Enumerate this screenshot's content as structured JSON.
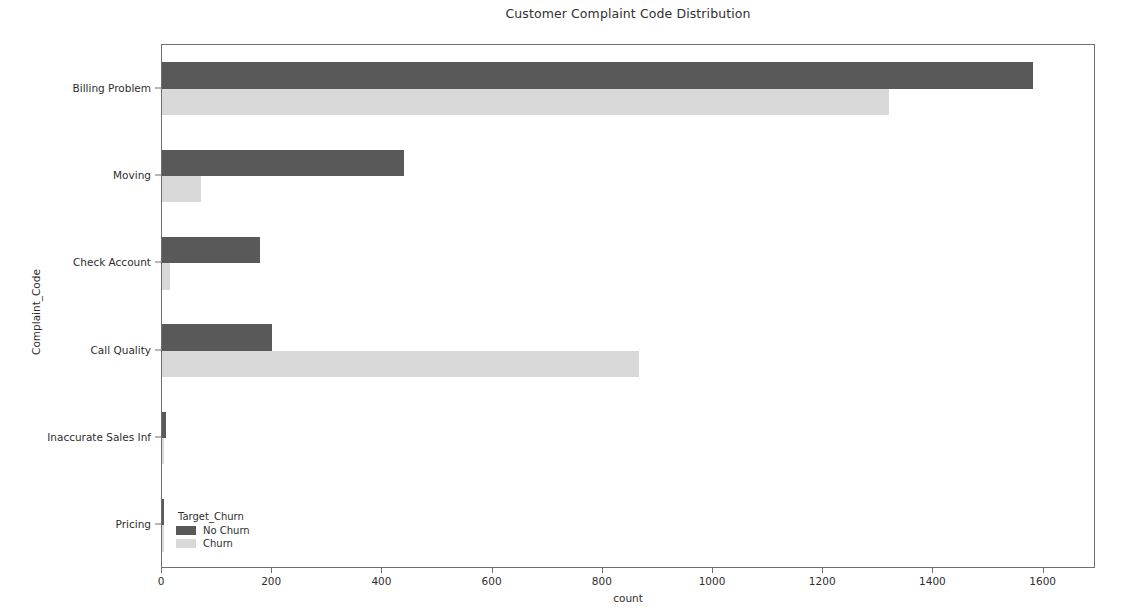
{
  "chart_data": {
    "type": "bar",
    "orientation": "horizontal",
    "title": "Customer Complaint Code Distribution",
    "xlabel": "count",
    "ylabel": "Complaint_Code",
    "categories": [
      "Billing Problem",
      "Moving",
      "Check Account",
      "Call Quality",
      "Inaccurate Sales Inf",
      "Pricing"
    ],
    "series": [
      {
        "name": "No Churn",
        "color": "#595959",
        "values": [
          1580,
          440,
          178,
          200,
          7,
          2
        ]
      },
      {
        "name": "Churn",
        "color": "#d9d9d9",
        "values": [
          1320,
          70,
          15,
          865,
          4,
          1
        ]
      }
    ],
    "xlim": [
      0,
      1695
    ],
    "xticks": [
      0,
      200,
      400,
      600,
      800,
      1000,
      1200,
      1400,
      1600
    ],
    "xticklabels": [
      "0",
      "200",
      "400",
      "600",
      "800",
      "1000",
      "1200",
      "1400",
      "1600"
    ],
    "grid": false,
    "legend": {
      "title": "Target_Churn",
      "position": "lower-left",
      "entries": [
        "No Churn",
        "Churn"
      ]
    }
  }
}
